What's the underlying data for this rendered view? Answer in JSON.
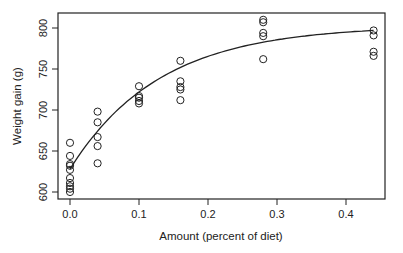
{
  "chart_data": {
    "type": "scatter",
    "title": "",
    "xlabel": "Amount (percent of diet)",
    "ylabel": "Weight gain (g)",
    "xlim": [
      -0.017,
      0.457
    ],
    "ylim": [
      590,
      820
    ],
    "x_ticks": [
      0.0,
      0.1,
      0.2,
      0.3,
      0.4
    ],
    "x_tick_labels": [
      "0.0",
      "0.1",
      "0.2",
      "0.3",
      "0.4"
    ],
    "y_ticks": [
      600,
      650,
      700,
      750,
      800
    ],
    "y_tick_labels": [
      "600",
      "650",
      "700",
      "750",
      "800"
    ],
    "grid": false,
    "legend": null,
    "marker": "open-circle",
    "series": [
      {
        "name": "observed",
        "type": "scatter",
        "points": [
          [
            0.0,
            660
          ],
          [
            0.0,
            644
          ],
          [
            0.0,
            634
          ],
          [
            0.0,
            632
          ],
          [
            0.0,
            627
          ],
          [
            0.0,
            617
          ],
          [
            0.0,
            611
          ],
          [
            0.0,
            607
          ],
          [
            0.0,
            604
          ],
          [
            0.0,
            600
          ],
          [
            0.04,
            698
          ],
          [
            0.04,
            685
          ],
          [
            0.04,
            667
          ],
          [
            0.04,
            656
          ],
          [
            0.04,
            635
          ],
          [
            0.1,
            729
          ],
          [
            0.1,
            717
          ],
          [
            0.1,
            715
          ],
          [
            0.1,
            711
          ],
          [
            0.1,
            708
          ],
          [
            0.16,
            760
          ],
          [
            0.16,
            735
          ],
          [
            0.16,
            728
          ],
          [
            0.16,
            725
          ],
          [
            0.16,
            712
          ],
          [
            0.28,
            810
          ],
          [
            0.28,
            807
          ],
          [
            0.28,
            794
          ],
          [
            0.28,
            790
          ],
          [
            0.28,
            762
          ],
          [
            0.44,
            797
          ],
          [
            0.44,
            791
          ],
          [
            0.44,
            771
          ],
          [
            0.44,
            766
          ]
        ]
      },
      {
        "name": "fitted curve",
        "type": "line",
        "model": "y = 628 + 175*(1 - exp(-x/0.13))",
        "x_range": [
          0.0,
          0.44
        ]
      }
    ]
  }
}
